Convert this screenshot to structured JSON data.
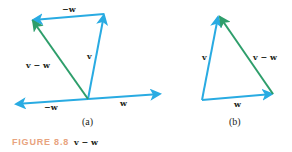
{
  "figure": {
    "caption_label": "FIGURE 8.8",
    "caption_text": "v − w",
    "colors": {
      "vector_blue": "#29abe2",
      "difference_green": "#2e9e6b",
      "caption_accent": "#e8a37e"
    },
    "panel_a": {
      "sublabel": "(a)",
      "labels": {
        "neg_w_top": "−w",
        "v": "v",
        "v_minus_w": "v − w",
        "neg_w_bottom": "−w",
        "w": "w"
      }
    },
    "panel_b": {
      "sublabel": "(b)",
      "labels": {
        "v": "v",
        "v_minus_w": "v − w",
        "w": "w"
      }
    }
  }
}
